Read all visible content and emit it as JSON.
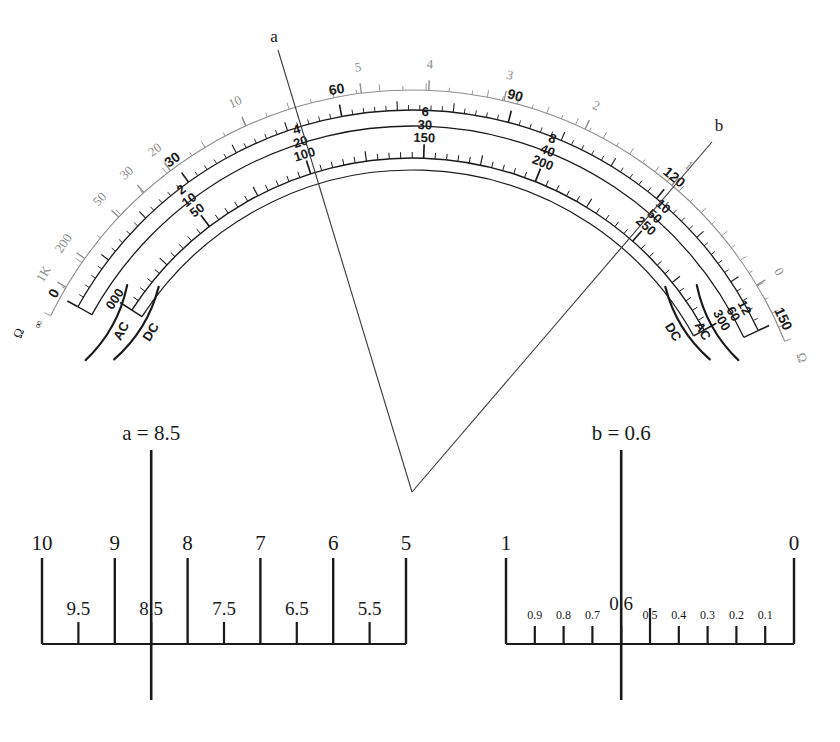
{
  "figure": {
    "ink_color": "#1a1a1a",
    "gray_color": "#8d8d8d"
  },
  "pointers": [
    {
      "id": "a",
      "label": "a",
      "label_x": 274,
      "label_y": 42,
      "tip_x": 412,
      "tip_y": 492,
      "tail_x": 278,
      "tail_y": 50
    },
    {
      "id": "b",
      "label": "b",
      "label_x": 719,
      "label_y": 131,
      "tip_x": 412,
      "tip_y": 492,
      "tail_x": 712,
      "tail_y": 142
    }
  ],
  "arc_scales": {
    "ohms_scale": {
      "name": "ohms",
      "symbol": "Ω",
      "infinity": "∞",
      "color": "#8d8d8d",
      "major_labels": [
        "1K",
        "200",
        "50",
        "20",
        "30",
        "10",
        "5",
        "4",
        "3",
        "2",
        "1",
        "0"
      ],
      "left_end_labels": [
        "1K",
        "200",
        "50"
      ],
      "right_end_labels": [
        "0"
      ]
    },
    "voltage_scale": {
      "name": "DC/AC volts",
      "labels": [
        "0",
        "30",
        "60",
        "90",
        "120",
        "150"
      ],
      "left_end_label": "0",
      "right_end_label": "150"
    },
    "current_scale": {
      "name": "current / lower multi-range",
      "stacked_label_groups": [
        {
          "values": [
            "000"
          ]
        },
        {
          "values": [
            "50",
            "10",
            "2"
          ]
        },
        {
          "values": [
            "100",
            "20",
            "4"
          ]
        },
        {
          "values": [
            "150",
            "30",
            "6"
          ]
        },
        {
          "values": [
            "200",
            "40",
            "8"
          ]
        },
        {
          "values": [
            "250",
            "50",
            "10"
          ]
        },
        {
          "values": [
            "300",
            "60",
            "12"
          ]
        }
      ]
    },
    "range_brackets": [
      {
        "side": "left",
        "labels": [
          "AC",
          "DC"
        ]
      },
      {
        "side": "right",
        "labels": [
          "AC",
          "DC"
        ]
      }
    ]
  },
  "expanded_scales": [
    {
      "id": "scale-a",
      "reading_label": "a = 8.5",
      "reading_value": 8.5,
      "direction": "descending",
      "major_ticks": [
        {
          "label": "10",
          "value": 10
        },
        {
          "label": "9",
          "value": 9
        },
        {
          "label": "8",
          "value": 8
        },
        {
          "label": "7",
          "value": 7
        },
        {
          "label": "6",
          "value": 6
        },
        {
          "label": "5",
          "value": 5
        }
      ],
      "minor_ticks": [
        {
          "label": "9.5",
          "value": 9.5
        },
        {
          "label": "8.5",
          "value": 8.5
        },
        {
          "label": "7.5",
          "value": 7.5
        },
        {
          "label": "6.5",
          "value": 6.5
        },
        {
          "label": "5.5",
          "value": 5.5
        }
      ],
      "axis_min": 5,
      "axis_max": 10
    },
    {
      "id": "scale-b",
      "reading_label": "b = 0.6",
      "reading_value": 0.6,
      "direction": "descending",
      "major_ticks": [
        {
          "label": "1",
          "value": 1
        },
        {
          "label": "0",
          "value": 0
        }
      ],
      "minor_ticks": [
        {
          "label": "0.9",
          "value": 0.9
        },
        {
          "label": "0.8",
          "value": 0.8
        },
        {
          "label": "0.7",
          "value": 0.7
        },
        {
          "label": "0.6",
          "value": 0.6
        },
        {
          "label": "0.5",
          "value": 0.5
        },
        {
          "label": "0.4",
          "value": 0.4
        },
        {
          "label": "0.3",
          "value": 0.3
        },
        {
          "label": "0.2",
          "value": 0.2
        },
        {
          "label": "0.1",
          "value": 0.1
        }
      ],
      "axis_min": 0,
      "axis_max": 1
    }
  ]
}
